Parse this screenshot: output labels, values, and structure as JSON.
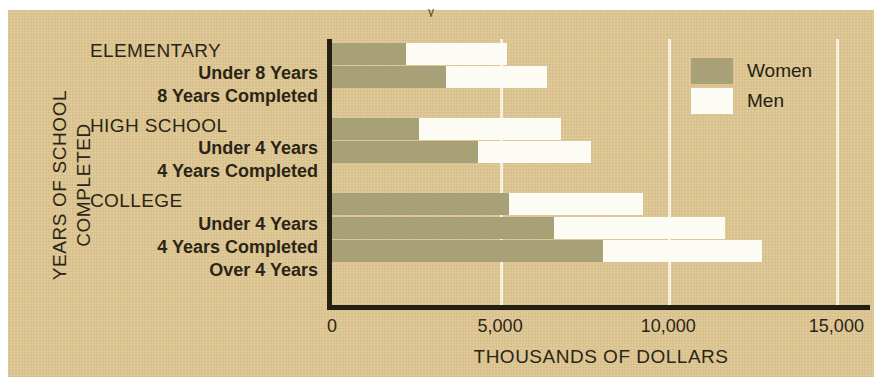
{
  "top_clip_text": "y",
  "axes": {
    "y_title_line1": "YEARS OF SCHOOL",
    "y_title_line2": "COMPLETED",
    "x_title": "THOUSANDS OF DOLLARS"
  },
  "legend": {
    "position": "inside-top-right",
    "items": [
      {
        "label": "Women",
        "color": "#a8a077",
        "swatch": "women-swatch"
      },
      {
        "label": "Men",
        "color": "#fdfcf4",
        "swatch": "men-swatch"
      }
    ]
  },
  "groups": [
    {
      "heading": "ELEMENTARY",
      "rows": [
        "Under 8 Years",
        "8 Years Completed"
      ]
    },
    {
      "heading": "HIGH SCHOOL",
      "rows": [
        "Under 4 Years",
        "4 Years Completed"
      ]
    },
    {
      "heading": "COLLEGE",
      "rows": [
        "Under 4 Years",
        "4 Years Completed",
        "Over 4 Years"
      ]
    }
  ],
  "chart_data": {
    "type": "bar",
    "orientation": "horizontal",
    "title": "",
    "subtitle": "",
    "xlabel": "THOUSANDS OF DOLLARS",
    "ylabel": "YEARS OF SCHOOL COMPLETED",
    "xlim": [
      0,
      16000
    ],
    "ylim": null,
    "grid": true,
    "grid_axis": "x",
    "legend_position": "inside-top-right",
    "xticks": [
      0,
      5000,
      10000,
      15000
    ],
    "xtick_labels": [
      "0",
      "5,000",
      "10,000",
      "15,000"
    ],
    "categories": [
      "ELEMENTARY - Under 8 Years",
      "ELEMENTARY - 8 Years Completed",
      "HIGH SCHOOL - Under 4 Years",
      "HIGH SCHOOL - 4 Years Completed",
      "COLLEGE - Under 4 Years",
      "COLLEGE - 4 Years Completed",
      "COLLEGE - Over 4 Years"
    ],
    "series": [
      {
        "name": "Women",
        "color": "#a8a077",
        "values": [
          2200,
          3400,
          2600,
          4350,
          5250,
          6600,
          8050
        ]
      },
      {
        "name": "Men",
        "color": "#fdfcf4",
        "values": [
          5200,
          6400,
          6800,
          7700,
          9250,
          11700,
          12800
        ]
      }
    ],
    "annotations": []
  },
  "palette": {
    "background": "#ddc591",
    "axis": "#241f12",
    "gridline": "#f6efdd",
    "text": "#2b2516",
    "women": "#a8a077",
    "men": "#fdfcf4"
  }
}
